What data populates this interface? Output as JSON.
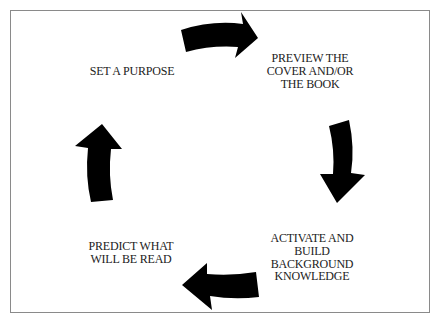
{
  "diagram": {
    "type": "cycle",
    "direction": "clockwise",
    "steps": [
      {
        "id": "set-purpose",
        "lines": [
          "SET A PURPOSE"
        ]
      },
      {
        "id": "preview",
        "lines": [
          "PREVIEW THE",
          "COVER AND/OR",
          "THE BOOK"
        ]
      },
      {
        "id": "activate",
        "lines": [
          "ACTIVATE AND",
          "BUILD",
          "BACKGROUND",
          "KNOWLEDGE"
        ]
      },
      {
        "id": "predict",
        "lines": [
          "PREDICT WHAT",
          "WILL BE READ"
        ]
      }
    ],
    "arrows": [
      {
        "from": "set-purpose",
        "to": "preview",
        "position": "top",
        "points": "right"
      },
      {
        "from": "preview",
        "to": "activate",
        "position": "right",
        "points": "down"
      },
      {
        "from": "activate",
        "to": "predict",
        "position": "bottom",
        "points": "left"
      },
      {
        "from": "predict",
        "to": "set-purpose",
        "position": "left",
        "points": "up"
      }
    ],
    "colors": {
      "arrow": "#000000",
      "text": "#222222",
      "border": "#8a8a8a",
      "background": "#ffffff"
    }
  }
}
